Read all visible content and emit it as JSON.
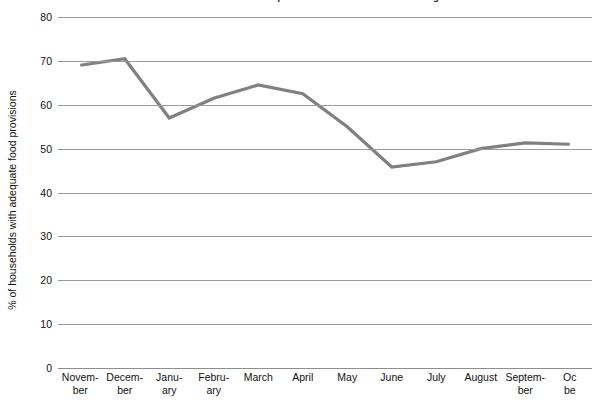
{
  "chart_data": {
    "type": "line",
    "title": "FIGURE 10. Months of Adequate Household Food Provisioning",
    "xlabel": "",
    "ylabel": "% of households with adequate food provisions",
    "categories": [
      "November",
      "December",
      "January",
      "February",
      "March",
      "April",
      "May",
      "June",
      "July",
      "August",
      "September",
      "October"
    ],
    "category_display": [
      "Novem-\nber",
      "Decem-\nber",
      "Janu-\nary",
      "Febru-\nary",
      "March",
      "April",
      "May",
      "June",
      "July",
      "August",
      "Septem-\nber",
      "Oc\nbe"
    ],
    "values": [
      69,
      70.5,
      57,
      61.5,
      64.5,
      62.5,
      55,
      45.8,
      47,
      50,
      51.3,
      51
    ],
    "ylim": [
      0,
      80
    ],
    "yticks": [
      0,
      10,
      20,
      30,
      40,
      50,
      60,
      70,
      80
    ],
    "ytick_labels": [
      "0",
      "10",
      "20",
      "30",
      "40",
      "50",
      "60",
      "70",
      "80"
    ],
    "grid": true,
    "legend": "none",
    "series_color": "#808080",
    "grid_color": "#9a9a9a",
    "line_width": 3.2
  },
  "figure": {
    "background": "#ffffff",
    "text_color": "#111111"
  }
}
